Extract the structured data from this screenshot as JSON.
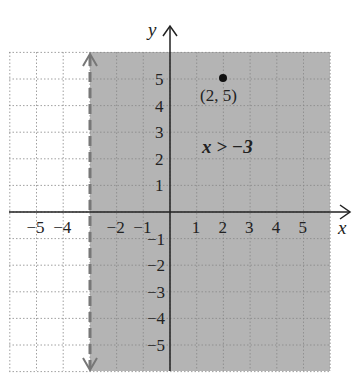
{
  "chart_data": {
    "type": "inequality-graph",
    "title": "",
    "xlabel": "x",
    "ylabel": "y",
    "xlim": [
      -6,
      6
    ],
    "ylim": [
      -6,
      6
    ],
    "grid": true,
    "x_ticks": [
      "−5",
      "−4",
      "−2",
      "−1",
      "1",
      "2",
      "3",
      "4",
      "5"
    ],
    "y_ticks": [
      "5",
      "4",
      "3",
      "2",
      "1",
      "−1",
      "−2",
      "−3",
      "−4",
      "−5"
    ],
    "boundary": {
      "equation": "x = -3",
      "style": "dashed",
      "color": "#777777"
    },
    "shaded_region": {
      "inequality": "x > −3",
      "color": "#b4b4b4"
    },
    "points": [
      {
        "x": 2,
        "y": 5,
        "label": "(2, 5)"
      }
    ],
    "annotation": "x > −3"
  }
}
